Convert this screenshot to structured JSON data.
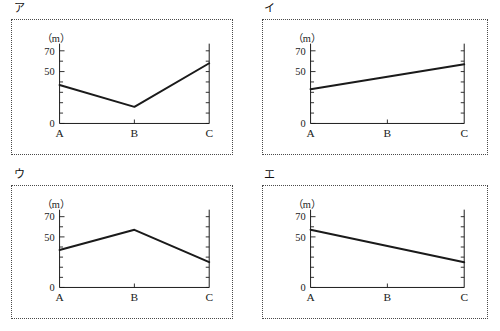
{
  "page": {
    "background_color": "#ffffff",
    "line_color": "#1a1a1a",
    "border_color": "#4a4a4a"
  },
  "panels": [
    {
      "tag": "ア",
      "chart_data": {
        "type": "line",
        "title": "",
        "unit_label": "（m）",
        "ylabel": "",
        "xlabel": "",
        "categories": [
          "A",
          "B",
          "C"
        ],
        "values": [
          37,
          16,
          58
        ],
        "ylim": [
          0,
          75
        ],
        "yticks_labeled": [
          0,
          50,
          70
        ],
        "yticks_minor_step": 10,
        "grid": false,
        "legend": "none",
        "description": "falls from A to B then rises steeply to C"
      }
    },
    {
      "tag": "イ",
      "chart_data": {
        "type": "line",
        "title": "",
        "unit_label": "（m）",
        "ylabel": "",
        "xlabel": "",
        "categories": [
          "A",
          "B",
          "C"
        ],
        "values": [
          33,
          45,
          57
        ],
        "ylim": [
          0,
          75
        ],
        "yticks_labeled": [
          0,
          50,
          70
        ],
        "yticks_minor_step": 10,
        "grid": false,
        "legend": "none",
        "description": "rises steadily in a straight line from A to C"
      }
    },
    {
      "tag": "ウ",
      "chart_data": {
        "type": "line",
        "title": "",
        "unit_label": "（m）",
        "ylabel": "",
        "xlabel": "",
        "categories": [
          "A",
          "B",
          "C"
        ],
        "values": [
          37,
          57,
          25
        ],
        "ylim": [
          0,
          75
        ],
        "yticks_labeled": [
          0,
          50,
          70
        ],
        "yticks_minor_step": 10,
        "grid": false,
        "legend": "none",
        "description": "rises from A to a peak at B then falls to C"
      }
    },
    {
      "tag": "エ",
      "chart_data": {
        "type": "line",
        "title": "",
        "unit_label": "（m）",
        "ylabel": "",
        "xlabel": "",
        "categories": [
          "A",
          "B",
          "C"
        ],
        "values": [
          57,
          41,
          25
        ],
        "ylim": [
          0,
          75
        ],
        "yticks_labeled": [
          0,
          50,
          70
        ],
        "yticks_minor_step": 10,
        "grid": false,
        "legend": "none",
        "description": "falls steadily in a straight line from A to C"
      }
    }
  ]
}
